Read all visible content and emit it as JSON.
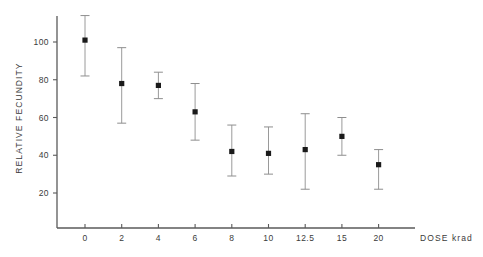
{
  "chart_data": {
    "type": "scatter",
    "title": "",
    "subtitle": "",
    "xlabel": "DOSE  krad",
    "ylabel": "RELATIVE  FECUNDITY",
    "categories": [
      "0",
      "2",
      "4",
      "6",
      "8",
      "10",
      "12.5",
      "15",
      "20"
    ],
    "x": [
      0,
      2,
      4,
      6,
      8,
      10,
      12.5,
      15,
      20
    ],
    "values": [
      101,
      78,
      77,
      63,
      42,
      41,
      43,
      50,
      35
    ],
    "error_low": [
      82,
      57,
      70,
      48,
      29,
      30,
      22,
      40,
      22
    ],
    "error_high": [
      114,
      97,
      84,
      78,
      56,
      55,
      62,
      60,
      43
    ],
    "series": [
      {
        "name": "Relative fecundity",
        "values": [
          101,
          78,
          77,
          63,
          42,
          41,
          43,
          50,
          35
        ]
      }
    ],
    "points": [
      {
        "dose": "0",
        "value": 101,
        "low": 82,
        "high": 114
      },
      {
        "dose": "2",
        "value": 78,
        "low": 57,
        "high": 97
      },
      {
        "dose": "4",
        "value": 77,
        "low": 70,
        "high": 84
      },
      {
        "dose": "6",
        "value": 63,
        "low": 48,
        "high": 78
      },
      {
        "dose": "8",
        "value": 42,
        "low": 29,
        "high": 56
      },
      {
        "dose": "10",
        "value": 41,
        "low": 30,
        "high": 55
      },
      {
        "dose": "12.5",
        "value": 43,
        "low": 22,
        "high": 62
      },
      {
        "dose": "15",
        "value": 50,
        "low": 40,
        "high": 60
      },
      {
        "dose": "20",
        "value": 35,
        "low": 22,
        "high": 43
      }
    ],
    "yticks": [
      20,
      40,
      60,
      80,
      100
    ],
    "ytick_labels": [
      "20",
      "40",
      "60",
      "80",
      "100"
    ],
    "xtick_labels": [
      "0",
      "2",
      "4",
      "6",
      "8",
      "10",
      "12.5",
      "15",
      "20"
    ],
    "ylim": [
      8,
      120
    ],
    "grid": false,
    "legend": null,
    "legend_position": "none",
    "marker_style": "filled-square",
    "error_bar_style": "capped",
    "colors": {
      "marker": "#1a1a1a",
      "error_bar": "#9a9a9a",
      "axis": "#5a5a5a",
      "text": "#3b3b3b",
      "background": "#ffffff"
    }
  }
}
